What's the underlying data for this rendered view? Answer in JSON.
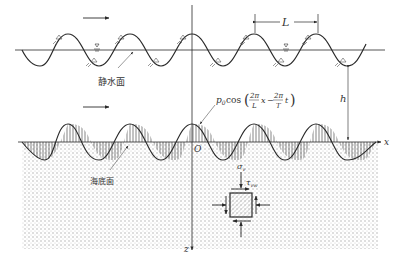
{
  "labels": {
    "still_water": "静水面",
    "seabed": "海底面",
    "wavelength": "L",
    "depth": "h",
    "x_axis": "x",
    "z_axis": "z",
    "origin": "O",
    "pressure": "p₀cos(2π/L x − 2π/T t)",
    "pressure_parts": {
      "p": "p",
      "sub": "0",
      "cos": "cos",
      "n1": "2π",
      "d1": "L",
      "x": "x",
      "minus": "−",
      "n2": "2π",
      "d2": "T",
      "t": "t"
    },
    "sigma": "σ",
    "sigma_sub": "v",
    "tau": "τ",
    "tau_sub": "vw"
  },
  "colors": {
    "line": "#2a2a2a",
    "dots": "#9a9a9a",
    "bg": "#ffffff"
  }
}
